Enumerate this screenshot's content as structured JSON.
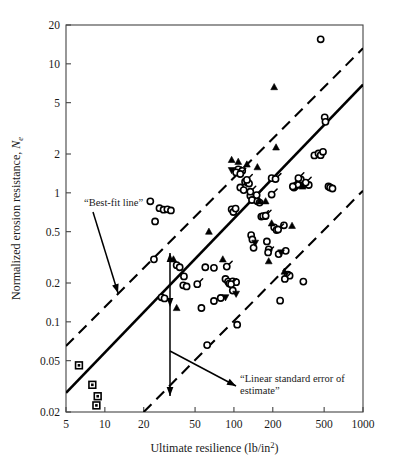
{
  "chart_data": {
    "type": "scatter",
    "title": "",
    "xlabel": "Ultimate resilience (lb/in2)",
    "xlabel_base": "Ultimate resilience (lb/in",
    "xlabel_sup": "2",
    "xlabel_close": ")",
    "ylabel_base": "Normalized erosion resistance, ",
    "ylabel_sym": "N",
    "ylabel_sub": "e",
    "xscale": "log",
    "yscale": "log",
    "xlim": [
      5,
      1000
    ],
    "ylim": [
      0.02,
      20
    ],
    "grid": false,
    "legend": "none",
    "xticks": [
      5,
      10,
      20,
      50,
      100,
      200,
      500,
      1000
    ],
    "xtick_labels": [
      "5",
      "10",
      "20",
      "50",
      "100",
      "200",
      "500",
      "1000"
    ],
    "yticks": [
      0.02,
      0.05,
      0.1,
      0.2,
      0.5,
      1,
      2,
      5,
      10,
      20
    ],
    "ytick_labels": [
      "0.02",
      "0.05",
      "0.1",
      "0.2",
      "0.5",
      "1",
      "2",
      "5",
      "10",
      "20"
    ],
    "annotations": [
      {
        "name": "best-fit-line-label",
        "text": "“Best-fit line”",
        "x": 13,
        "y": 0.93
      },
      {
        "name": "linear-standard-error-label-line1",
        "text": "“Linear standard error of",
        "x": 78,
        "y": 0.052
      },
      {
        "name": "linear-standard-error-label-line2",
        "text": "estimate”",
        "x": 78,
        "y": 0.04
      }
    ],
    "lines": [
      {
        "name": "best-fit-line",
        "style": "solid",
        "points": [
          [
            5,
            0.0282
          ],
          [
            1000,
            6.9
          ]
        ]
      },
      {
        "name": "upper-standard-error-line",
        "style": "dashed",
        "points": [
          [
            5,
            0.065
          ],
          [
            1000,
            13.2
          ]
        ]
      },
      {
        "name": "lower-standard-error-line",
        "style": "dashed",
        "points": [
          [
            20,
            0.02
          ],
          [
            1000,
            1.04
          ]
        ]
      }
    ],
    "series": [
      {
        "name": "square-markers",
        "marker": "square-dot",
        "points": [
          [
            6.3,
            0.046
          ],
          [
            8.0,
            0.0325
          ],
          [
            8.8,
            0.0265
          ],
          [
            8.6,
            0.0225
          ]
        ]
      },
      {
        "name": "open-circle-markers",
        "marker": "circle-open",
        "points": [
          [
            22.5,
            0.86
          ],
          [
            26.5,
            0.76
          ],
          [
            28.5,
            0.74
          ],
          [
            30.5,
            0.745
          ],
          [
            32.5,
            0.73
          ],
          [
            24.5,
            0.6
          ],
          [
            24.0,
            0.305
          ],
          [
            27.5,
            0.155
          ],
          [
            29.0,
            0.152
          ],
          [
            36.0,
            0.275
          ],
          [
            38.0,
            0.265
          ],
          [
            41.0,
            0.225
          ],
          [
            40.5,
            0.192
          ],
          [
            43.0,
            0.188
          ],
          [
            60.0,
            0.265
          ],
          [
            70.0,
            0.262
          ],
          [
            79.0,
            0.153
          ],
          [
            86.0,
            0.215
          ],
          [
            90.0,
            0.205
          ],
          [
            92.0,
            0.198
          ],
          [
            98.0,
            0.206
          ],
          [
            104.0,
            0.203
          ],
          [
            96.0,
            0.745
          ],
          [
            99.0,
            0.71
          ],
          [
            103.0,
            0.755
          ],
          [
            108.0,
            1.52
          ],
          [
            112.0,
            1.1
          ],
          [
            116.0,
            1.48
          ],
          [
            119.0,
            1.05
          ],
          [
            122.0,
            1.22
          ],
          [
            128.0,
            1.2
          ],
          [
            131.0,
            1.18
          ],
          [
            134.0,
            0.95
          ],
          [
            138.0,
            0.88
          ],
          [
            136.0,
            0.47
          ],
          [
            139.0,
            0.435
          ],
          [
            142.0,
            0.375
          ],
          [
            152.0,
            0.86
          ],
          [
            158.0,
            0.84
          ],
          [
            163.0,
            0.655
          ],
          [
            175.0,
            0.66
          ],
          [
            180.0,
            0.42
          ],
          [
            186.0,
            0.365
          ],
          [
            196.0,
            1.3
          ],
          [
            205.0,
            0.54
          ],
          [
            214.0,
            0.515
          ],
          [
            222.0,
            0.335
          ],
          [
            244.0,
            0.56
          ],
          [
            252.0,
            0.355
          ],
          [
            262.0,
            0.232
          ],
          [
            270.0,
            0.228
          ],
          [
            292.0,
            1.1
          ],
          [
            300.0,
            1.13
          ],
          [
            312.0,
            1.16
          ],
          [
            330.0,
            1.27
          ],
          [
            345.0,
            0.205
          ],
          [
            355.0,
            1.17
          ],
          [
            380.0,
            1.15
          ],
          [
            420.0,
            1.95
          ],
          [
            452.0,
            2.02
          ],
          [
            470.0,
            1.96
          ],
          [
            490.0,
            2.08
          ],
          [
            470.0,
            15.5
          ],
          [
            505.0,
            3.85
          ],
          [
            512.0,
            3.55
          ],
          [
            540.0,
            1.12
          ],
          [
            556.0,
            1.1
          ],
          [
            580.0,
            1.08
          ],
          [
            106.0,
            0.095
          ],
          [
            98.0,
            0.175
          ],
          [
            70.0,
            0.145
          ],
          [
            62.0,
            0.066
          ],
          [
            56.0,
            0.128
          ],
          [
            228.0,
            0.146
          ]
        ]
      },
      {
        "name": "circle-with-tail-markers",
        "marker": "circle-tail",
        "points": [
          [
            104.0,
            1.44
          ],
          [
            112.0,
            1.4
          ],
          [
            126.0,
            1.26
          ],
          [
            134.0,
            1.02
          ],
          [
            150.0,
            0.96
          ],
          [
            168.0,
            0.66
          ],
          [
            176.0,
            0.665
          ],
          [
            184.0,
            0.345
          ],
          [
            196.0,
            0.97
          ],
          [
            210.0,
            1.28
          ],
          [
            220.0,
            0.52
          ],
          [
            248.0,
            0.215
          ],
          [
            286.0,
            1.12
          ],
          [
            316.0,
            1.3
          ],
          [
            360.0,
            1.2
          ],
          [
            95.0,
            0.196
          ],
          [
            88.0,
            0.268
          ],
          [
            52.0,
            0.196
          ]
        ]
      },
      {
        "name": "filled-triangle-up-markers",
        "marker": "triangle-up",
        "points": [
          [
            34.0,
            0.305
          ],
          [
            36.0,
            0.128
          ],
          [
            64.0,
            0.5
          ],
          [
            82.0,
            0.305
          ],
          [
            96.0,
            1.8
          ],
          [
            108.0,
            1.74
          ],
          [
            126.0,
            1.66
          ],
          [
            152.0,
            1.58
          ],
          [
            158.0,
            0.86
          ],
          [
            176.0,
            0.86
          ],
          [
            186.0,
            0.295
          ],
          [
            196.0,
            0.58
          ],
          [
            205.0,
            6.6
          ],
          [
            212.0,
            2.25
          ],
          [
            246.0,
            0.245
          ],
          [
            282.0,
            0.555
          ],
          [
            340.0,
            1.12
          ]
        ]
      },
      {
        "name": "filled-triangle-down-markers",
        "marker": "triangle-down",
        "points": [
          [
            96.0,
            1.5
          ],
          [
            86.0,
            0.155
          ],
          [
            104.0,
            0.165
          ],
          [
            146.0,
            0.41
          ],
          [
            232.0,
            0.345
          ]
        ]
      }
    ]
  }
}
